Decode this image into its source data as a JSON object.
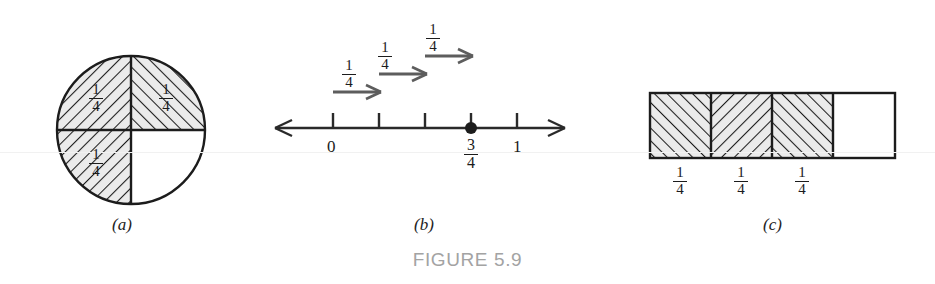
{
  "figure": {
    "caption": "FIGURE 5.9",
    "panels": [
      {
        "id": "a",
        "label": "(a)",
        "kind": "circle-fraction-model"
      },
      {
        "id": "b",
        "label": "(b)",
        "kind": "number-line-model"
      },
      {
        "id": "c",
        "label": "(c)",
        "kind": "rectangle-bar-model"
      }
    ]
  },
  "colors": {
    "ink": "#1c1c1c",
    "shaded_fill": "#ebebeb",
    "hatch_stroke": "#1c1c1c",
    "arrow_gray": "#5d5d5d",
    "caption_gray": "#a3a3a3",
    "white": "#ffffff",
    "scanline": "#f1f1f1"
  },
  "panel_a": {
    "label": "(a)",
    "shape": "circle",
    "total_parts": 4,
    "shaded_parts": 3,
    "quadrant_labels": [
      "1/4",
      "1/4",
      "1/4"
    ],
    "quadrants": [
      {
        "name": "top-left",
        "shaded": true,
        "hatch": "backslash",
        "label_num": "1",
        "label_den": "4"
      },
      {
        "name": "top-right",
        "shaded": true,
        "hatch": "slash",
        "label_num": "1",
        "label_den": "4"
      },
      {
        "name": "bottom-left",
        "shaded": true,
        "hatch": "backslash",
        "label_num": "1",
        "label_den": "4"
      },
      {
        "name": "bottom-right",
        "shaded": false,
        "hatch": "none",
        "label_num": "",
        "label_den": ""
      }
    ]
  },
  "panel_b": {
    "label": "(b)",
    "shape": "number-line",
    "axis_ticks": [
      "0",
      "",
      "",
      "",
      "1"
    ],
    "tick_values": [
      0,
      0.25,
      0.5,
      0.75,
      1
    ],
    "visible_tick_labels": [
      {
        "value": 0,
        "text": "0"
      },
      {
        "value": 1,
        "text": "1"
      }
    ],
    "point": {
      "value": "3/4",
      "num": "3",
      "den": "4",
      "marker": "filled-dot"
    },
    "jumps": [
      {
        "index": 1,
        "num": "1",
        "den": "4",
        "from": 0,
        "to": 0.25
      },
      {
        "index": 2,
        "num": "1",
        "den": "4",
        "from": 0.25,
        "to": 0.5
      },
      {
        "index": 3,
        "num": "1",
        "den": "4",
        "from": 0.5,
        "to": 0.75
      }
    ],
    "arrow_labels": [
      "1/4",
      "1/4",
      "1/4"
    ],
    "axis_direction": "double-arrow"
  },
  "panel_c": {
    "label": "(c)",
    "shape": "rectangle",
    "total_parts": 4,
    "shaded_parts": 3,
    "cells": [
      {
        "index": 1,
        "shaded": true,
        "hatch": "slash",
        "label_num": "1",
        "label_den": "4"
      },
      {
        "index": 2,
        "shaded": true,
        "hatch": "backslash",
        "label_num": "1",
        "label_den": "4"
      },
      {
        "index": 3,
        "shaded": true,
        "hatch": "slash",
        "label_num": "1",
        "label_den": "4"
      },
      {
        "index": 4,
        "shaded": false,
        "hatch": "none",
        "label_num": "",
        "label_den": ""
      }
    ],
    "cell_labels": [
      "1/4",
      "1/4",
      "1/4"
    ]
  }
}
